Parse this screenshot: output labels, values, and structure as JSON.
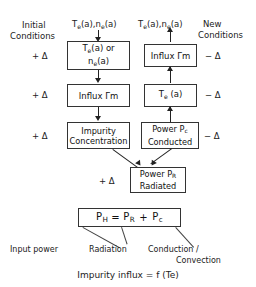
{
  "figure": {
    "top_trim_text": "",
    "headers": {
      "initial_conditions": "Initial\nConditions",
      "initial_conditions_line1": "Initial",
      "initial_conditions_line2": "Conditions",
      "new_conditions_line1": "New",
      "new_conditions_line2": "Conditions",
      "left_input_label": "Te(a),ne(a)",
      "right_output_label": "Te(a),ne(a)"
    },
    "delta_plus": "+ Δ",
    "delta_minus": "− Δ",
    "left_column": {
      "deltas": [
        "+ Δ",
        "+ Δ",
        "+ Δ"
      ],
      "boxes": [
        {
          "id": "te-or-ne",
          "line1": "Te(a) or",
          "line2": "ne(a)"
        },
        {
          "id": "influx-left",
          "line1": "Influx Γm",
          "line2": ""
        },
        {
          "id": "impurity-concentration",
          "line1": "Impurity",
          "line2": "Concentration"
        }
      ]
    },
    "right_column": {
      "deltas": [
        "− Δ",
        "− Δ",
        "− Δ"
      ],
      "boxes": [
        {
          "id": "influx-right",
          "line1": "Influx Γm",
          "line2": ""
        },
        {
          "id": "te-a",
          "line1": "Te (a)",
          "line2": ""
        },
        {
          "id": "power-pc-conducted",
          "line1": "Power Pc",
          "line2": "Conducted"
        }
      ]
    },
    "radiated_box": {
      "id": "power-pr-radiated",
      "line1": "Power PR",
      "line2": "Radiated",
      "delta": "+ Δ"
    },
    "equation": {
      "box_text": "PH  =  PR   +   Pc",
      "terms": {
        "ph": "PH",
        "eq": "=",
        "pr": "PR",
        "plus": "+",
        "pc": "Pc"
      },
      "callouts": [
        {
          "id": "input-power",
          "label": "Input power"
        },
        {
          "id": "radiation",
          "label": "Radiation"
        },
        {
          "id": "conduction-convection-1",
          "label": "Conduction /"
        },
        {
          "id": "conduction-convection-2",
          "label": "Convection"
        }
      ]
    },
    "footer_note": "Impurity influx  =  f (Te)"
  }
}
